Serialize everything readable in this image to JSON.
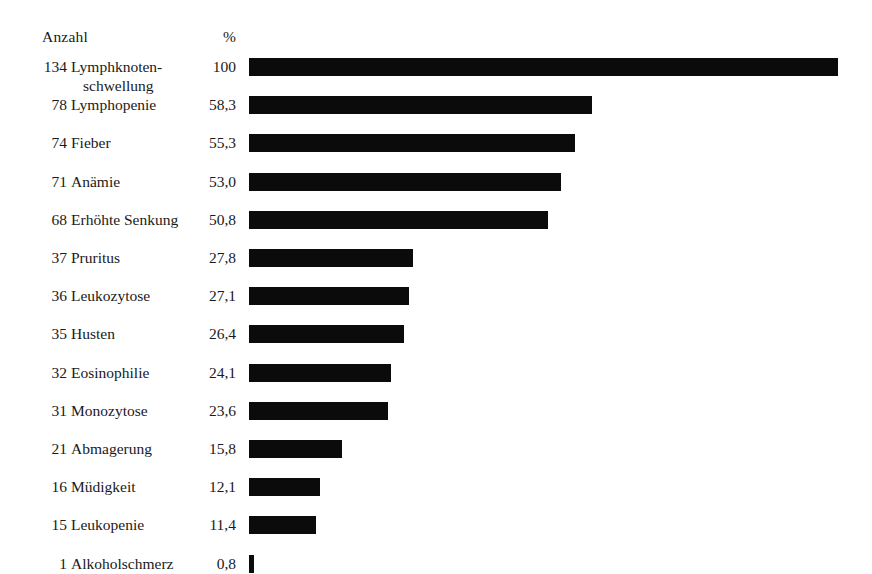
{
  "header": {
    "count_label": "Anzahl",
    "percent_label": "%"
  },
  "chart_data": {
    "type": "bar",
    "title": "",
    "subtitle": "",
    "xlabel": "",
    "ylabel": "",
    "orientation": "horizontal",
    "grid": false,
    "legend": "none",
    "xlim": [
      0,
      100
    ],
    "value_unit": "%",
    "decimal_separator": ",",
    "bar_color": "#0b0b0b",
    "background_color": "#ffffff",
    "columns": [
      "Anzahl",
      "Symptom",
      "%"
    ],
    "categories": [
      "Lymphknotenschwellung",
      "Lymphopenie",
      "Fieber",
      "Anämie",
      "Erhöhte Senkung",
      "Pruritus",
      "Leukozytose",
      "Husten",
      "Eosinophilie",
      "Monozytose",
      "Abmagerung",
      "Müdigkeit",
      "Leukopenie",
      "Alkoholschmerz"
    ],
    "values": [
      100,
      58.3,
      55.3,
      53.0,
      50.8,
      27.8,
      27.1,
      26.4,
      24.1,
      23.6,
      15.8,
      12.1,
      11.4,
      0.8
    ],
    "counts": [
      134,
      78,
      74,
      71,
      68,
      37,
      36,
      35,
      32,
      31,
      21,
      16,
      15,
      1
    ],
    "rows": [
      {
        "count": "134",
        "label_line1": "Lymphknoten-",
        "label_line2": "schwellung",
        "percent": "100",
        "value": 100
      },
      {
        "count": "78",
        "label_line1": "Lymphopenie",
        "label_line2": "",
        "percent": "58,3",
        "value": 58.3
      },
      {
        "count": "74",
        "label_line1": "Fieber",
        "label_line2": "",
        "percent": "55,3",
        "value": 55.3
      },
      {
        "count": "71",
        "label_line1": "Anämie",
        "label_line2": "",
        "percent": "53,0",
        "value": 53.0
      },
      {
        "count": "68",
        "label_line1": "Erhöhte Senkung",
        "label_line2": "",
        "percent": "50,8",
        "value": 50.8
      },
      {
        "count": "37",
        "label_line1": "Pruritus",
        "label_line2": "",
        "percent": "27,8",
        "value": 27.8
      },
      {
        "count": "36",
        "label_line1": "Leukozytose",
        "label_line2": "",
        "percent": "27,1",
        "value": 27.1
      },
      {
        "count": "35",
        "label_line1": "Husten",
        "label_line2": "",
        "percent": "26,4",
        "value": 26.4
      },
      {
        "count": "32",
        "label_line1": "Eosinophilie",
        "label_line2": "",
        "percent": "24,1",
        "value": 24.1
      },
      {
        "count": "31",
        "label_line1": "Monozytose",
        "label_line2": "",
        "percent": "23,6",
        "value": 23.6
      },
      {
        "count": "21",
        "label_line1": "Abmagerung",
        "label_line2": "",
        "percent": "15,8",
        "value": 15.8
      },
      {
        "count": "16",
        "label_line1": "Müdigkeit",
        "label_line2": "",
        "percent": "12,1",
        "value": 12.1
      },
      {
        "count": "15",
        "label_line1": "Leukopenie",
        "label_line2": "",
        "percent": "11,4",
        "value": 11.4
      },
      {
        "count": "1",
        "label_line1": "Alkoholschmerz",
        "label_line2": "",
        "percent": "0,8",
        "value": 0.8
      }
    ]
  },
  "layout": {
    "bar_origin_x": 249,
    "bar_full_width": 589,
    "first_row_y": 58,
    "row_step": 38.2,
    "bar_height": 18
  }
}
